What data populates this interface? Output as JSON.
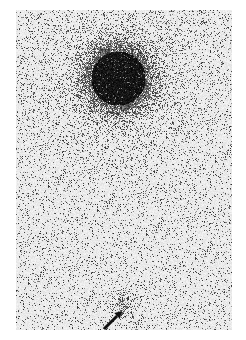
{
  "image": {
    "description": "Grayscale scintigraphy scan with a large dark uptake region near the top and a small faint focus near the bottom indicated by a black arrow",
    "colors": {
      "background": "#ffffff",
      "panel": "#ececec",
      "uptake": "#0a0a0a",
      "arrow": "#111111"
    },
    "panel": {
      "x": 16,
      "y": 10,
      "width": 216,
      "height": 320
    },
    "major_uptake": {
      "cx": 102,
      "cy": 68,
      "r": 36
    },
    "minor_focus": {
      "cx": 107,
      "cy": 295,
      "r": 11
    },
    "arrow": {
      "from": [
        104,
        329
      ],
      "to": [
        122,
        311
      ]
    }
  }
}
